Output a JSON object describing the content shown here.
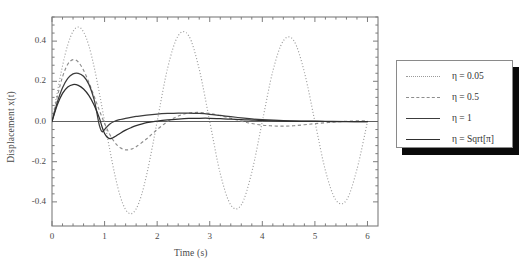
{
  "chart_data": {
    "type": "line",
    "title": "",
    "xlabel": "Time (s)",
    "ylabel": "Displacement x(t)",
    "xlim": [
      0,
      6.2
    ],
    "ylim": [
      -0.52,
      0.52
    ],
    "xticks": [
      0,
      1,
      2,
      3,
      4,
      5,
      6
    ],
    "xtick_labels": [
      "0",
      "1",
      "2",
      "3",
      "4",
      "5",
      "6"
    ],
    "yticks": [
      -0.4,
      -0.2,
      0.0,
      0.2,
      0.4
    ],
    "ytick_labels": [
      "-0.4",
      "-0.2",
      "0.0",
      "0.2",
      "0.4"
    ],
    "minor_tick_count": 4,
    "grid": false,
    "legend_position": "right-outside",
    "zero_line": true,
    "series": [
      {
        "name": "η = 0.05",
        "eta": 0.05,
        "style": "dotted",
        "color": "#9a9a9a",
        "amplitude": 0.47,
        "period": 2.0,
        "phase": 0.0,
        "x": [
          0.0,
          0.1,
          0.2,
          0.3,
          0.4,
          0.5,
          0.6,
          0.7,
          0.8,
          0.9,
          1.0,
          1.1,
          1.2,
          1.3,
          1.4,
          1.5,
          1.6,
          1.7,
          1.8,
          1.9,
          2.0,
          2.2,
          2.4,
          2.6,
          2.8,
          3.0,
          3.2,
          3.4,
          3.6,
          3.8,
          4.0,
          4.2,
          4.4,
          4.6,
          4.8,
          5.0,
          5.2,
          5.4,
          5.6,
          5.8,
          6.0
        ],
        "y": [
          0.0,
          0.145,
          0.277,
          0.382,
          0.448,
          0.47,
          0.446,
          0.378,
          0.273,
          0.142,
          0.0,
          -0.142,
          -0.271,
          -0.374,
          -0.438,
          -0.459,
          -0.435,
          -0.368,
          -0.265,
          -0.138,
          0.0,
          0.267,
          0.427,
          0.427,
          0.26,
          0.0,
          -0.259,
          -0.415,
          -0.415,
          -0.252,
          0.0,
          0.251,
          0.402,
          0.402,
          0.245,
          0.0,
          -0.244,
          -0.391,
          -0.391,
          -0.238,
          0.0
        ]
      },
      {
        "name": "η = 0.5",
        "eta": 0.5,
        "style": "dashed",
        "color": "#8d8d8d",
        "amplitude": 0.31,
        "x": [
          0.0,
          0.1,
          0.2,
          0.3,
          0.4,
          0.5,
          0.6,
          0.7,
          0.8,
          0.9,
          1.0,
          1.1,
          1.2,
          1.3,
          1.4,
          1.5,
          1.6,
          1.8,
          2.0,
          2.2,
          2.4,
          2.6,
          2.8,
          3.0,
          3.2,
          3.4,
          3.6,
          3.8,
          4.0,
          4.2,
          4.4,
          4.6,
          4.8,
          5.0,
          5.4,
          5.8,
          6.0
        ],
        "y": [
          0.0,
          0.122,
          0.222,
          0.285,
          0.308,
          0.296,
          0.255,
          0.196,
          0.127,
          0.056,
          -0.01,
          -0.065,
          -0.106,
          -0.131,
          -0.141,
          -0.138,
          -0.126,
          -0.086,
          -0.04,
          0.0,
          0.027,
          0.042,
          0.045,
          0.04,
          0.029,
          0.016,
          0.002,
          -0.01,
          -0.018,
          -0.022,
          -0.023,
          -0.021,
          -0.016,
          -0.011,
          -0.002,
          0.003,
          0.003
        ]
      },
      {
        "name": "η = 1",
        "eta": 1,
        "style": "solid",
        "color": "#3c3c3c",
        "amplitude": 0.24,
        "x": [
          0.0,
          0.1,
          0.2,
          0.3,
          0.4,
          0.5,
          0.6,
          0.7,
          0.8,
          0.85,
          0.9,
          0.95,
          1.0,
          1.1,
          1.2,
          1.3,
          1.4,
          1.5,
          1.6,
          1.8,
          2.0,
          2.2,
          2.4,
          2.6,
          2.8,
          3.0,
          3.2,
          3.4,
          3.6,
          3.8,
          4.0,
          4.4,
          4.8,
          5.2,
          5.6,
          6.0
        ],
        "y": [
          0.0,
          0.095,
          0.168,
          0.215,
          0.237,
          0.24,
          0.225,
          0.186,
          0.11,
          0.048,
          -0.018,
          -0.05,
          -0.04,
          -0.012,
          0.002,
          0.01,
          0.016,
          0.021,
          0.025,
          0.032,
          0.037,
          0.04,
          0.042,
          0.042,
          0.04,
          0.036,
          0.03,
          0.024,
          0.018,
          0.013,
          0.009,
          0.004,
          0.002,
          0.001,
          0.0,
          0.0
        ]
      },
      {
        "name": "η = Sqrt[π]",
        "eta": 1.7724539,
        "style": "solid",
        "color": "#2f2f2f",
        "amplitude": 0.185,
        "x": [
          0.0,
          0.1,
          0.2,
          0.3,
          0.4,
          0.5,
          0.6,
          0.7,
          0.8,
          0.9,
          0.95,
          1.0,
          1.05,
          1.1,
          1.15,
          1.2,
          1.3,
          1.4,
          1.5,
          1.6,
          1.8,
          2.0,
          2.2,
          2.4,
          2.6,
          2.8,
          3.0,
          3.2,
          3.4,
          3.6,
          3.8,
          4.0,
          4.4,
          4.8,
          5.2,
          5.6,
          6.0
        ],
        "y": [
          0.0,
          0.082,
          0.14,
          0.172,
          0.184,
          0.18,
          0.162,
          0.13,
          0.082,
          0.018,
          -0.025,
          -0.06,
          -0.078,
          -0.085,
          -0.082,
          -0.075,
          -0.058,
          -0.043,
          -0.031,
          -0.021,
          -0.006,
          0.002,
          0.008,
          0.012,
          0.015,
          0.016,
          0.016,
          0.014,
          0.012,
          0.009,
          0.007,
          0.005,
          0.002,
          0.001,
          0.0,
          0.0,
          0.0
        ]
      }
    ]
  },
  "axes": {
    "frame_color": "#7d7d7d",
    "zero_line_color": "#5e5e5e"
  }
}
